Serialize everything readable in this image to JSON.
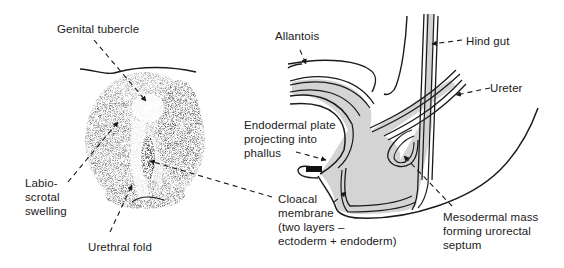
{
  "diagram": {
    "left_panel": {
      "subject": "external genitalia (indifferent stage)",
      "labels": {
        "genital_tubercle": "Genital tubercle",
        "labioscrotal_swelling": "Labio-\nscrotal\nswelling",
        "urethral_fold": "Urethral fold"
      }
    },
    "right_panel": {
      "subject": "sagittal section of cloaca",
      "labels": {
        "allantois": "Allantois",
        "hind_gut": "Hind gut",
        "ureter": "Ureter",
        "endodermal_plate": "Endodermal plate\nprojecting into\nphallus",
        "cloacal_membrane": "Cloacal\nmembrane\n(two layers –\nectoderm + endoderm)",
        "mesodermal_mass": "Mesodermal mass\nforming urorectal\nseptum"
      }
    },
    "colors": {
      "ink": "#1a1a1a",
      "endoderm_fill": "#d4d4d4",
      "stipple": "#555555",
      "background": "#ffffff"
    }
  }
}
